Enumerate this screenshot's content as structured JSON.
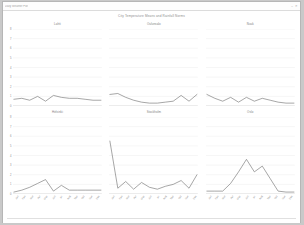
{
  "window": {
    "title": "Daily Weather Plot",
    "controls": [
      "minimize-icon",
      "close-icon"
    ]
  },
  "figure": {
    "title": "City Temperature Means and Rainfall Norms"
  },
  "chart_data": {
    "type": "line",
    "title": "City Temperature Means and Rainfall Norms",
    "xlabel": "",
    "ylabel": "",
    "ylim": [
      0,
      8
    ],
    "grid": true,
    "legend": "none",
    "categories": [
      "Jan",
      "Feb",
      "Mar",
      "Apr",
      "May",
      "Jun",
      "Jul",
      "Aug",
      "Sep",
      "Oct",
      "Nov",
      "Dec"
    ],
    "yticks": [
      0,
      1,
      2,
      3,
      4,
      5,
      6,
      7,
      8
    ],
    "panels": [
      {
        "title": "Lahti",
        "row": 1,
        "col": 1,
        "values": [
          0.7,
          0.8,
          0.6,
          1.0,
          0.5,
          1.1,
          0.9,
          0.8,
          0.8,
          0.7,
          0.6,
          0.6
        ]
      },
      {
        "title": "Oulunsalo",
        "row": 1,
        "col": 2,
        "values": [
          1.2,
          1.3,
          0.9,
          0.6,
          0.4,
          0.3,
          0.3,
          0.4,
          0.5,
          1.1,
          0.5,
          1.2
        ]
      },
      {
        "title": "Nuuk",
        "row": 1,
        "col": 3,
        "values": [
          1.2,
          0.8,
          0.5,
          0.9,
          0.4,
          0.9,
          0.5,
          0.8,
          0.6,
          0.4,
          0.3,
          0.3
        ]
      },
      {
        "title": "Helsinki",
        "row": 2,
        "col": 1,
        "values": [
          0.2,
          0.4,
          0.7,
          1.1,
          1.5,
          0.3,
          0.9,
          0.4,
          0.4,
          0.4,
          0.4,
          0.4
        ]
      },
      {
        "title": "Stockholm",
        "row": 2,
        "col": 2,
        "values": [
          5.5,
          0.6,
          1.3,
          0.5,
          1.2,
          0.7,
          0.5,
          0.8,
          1.0,
          1.4,
          0.6,
          2.0
        ]
      },
      {
        "title": "Oslo",
        "row": 2,
        "col": 3,
        "values": [
          0.3,
          0.3,
          0.3,
          1.1,
          2.3,
          3.6,
          2.3,
          2.9,
          1.6,
          0.3,
          0.2,
          0.2
        ]
      }
    ]
  }
}
